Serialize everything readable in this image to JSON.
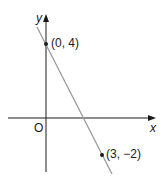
{
  "diagram": {
    "type": "coordinate-graph",
    "axes": {
      "x_label": "x",
      "y_label": "y",
      "origin_label": "O"
    },
    "line": {
      "color": "#9a9a9a",
      "slope": -2,
      "y_intercept": 4
    },
    "points": [
      {
        "label": "(0, 4)",
        "x": 0,
        "y": 4
      },
      {
        "label": "(3, −2)",
        "x": 3,
        "y": -2
      }
    ],
    "colors": {
      "axis": "#1a1a1a",
      "line": "#9a9a9a",
      "point": "#1a1a1a"
    }
  }
}
